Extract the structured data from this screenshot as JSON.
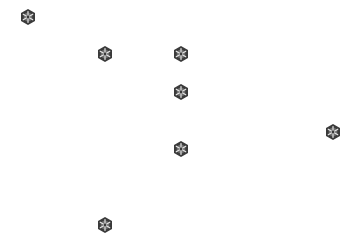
{
  "canvas": {
    "background": "#ffffff",
    "width": 354,
    "height": 243
  },
  "icon": {
    "semantic": "hexagon-snowflake-icon",
    "fill_dark": "#3a3a3a",
    "fill_mid": "#6e6e6e",
    "highlight": "#e6e6e6"
  },
  "nodes": [
    {
      "id": 1,
      "x": 28,
      "y": 17
    },
    {
      "id": 2,
      "x": 105,
      "y": 54
    },
    {
      "id": 3,
      "x": 181,
      "y": 54
    },
    {
      "id": 4,
      "x": 181,
      "y": 92
    },
    {
      "id": 5,
      "x": 181,
      "y": 149
    },
    {
      "id": 6,
      "x": 333,
      "y": 132
    },
    {
      "id": 7,
      "x": 105,
      "y": 225
    }
  ]
}
